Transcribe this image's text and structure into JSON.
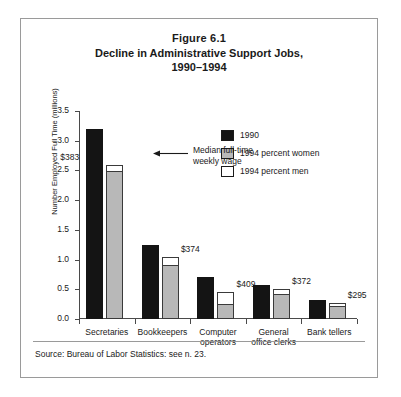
{
  "figure": {
    "number": "Figure 6.1",
    "title": "Decline in Administrative Support Jobs,",
    "title_line2": "1990–1994",
    "source": "Source: Bureau of Labor Statistics: see n. 23.",
    "annotation_line1": "Median full-time",
    "annotation_line2": "weekly wage",
    "arrow_icon": "arrow-left-icon"
  },
  "colors": {
    "bar_1990": "#141414",
    "bar_1994_women": "#b8b8b8",
    "bar_1994_men": "#ffffff",
    "outline": "#3a3a3a",
    "axis": "#4a4a4a",
    "frame": "#9a9a9a"
  },
  "legend": {
    "position": "top-right",
    "items": [
      {
        "label": "1990",
        "swatch": "#141414"
      },
      {
        "label": "1994 percent women",
        "swatch": "#b8b8b8"
      },
      {
        "label": "1994 percent men",
        "swatch": "#ffffff"
      }
    ]
  },
  "chart_data": {
    "type": "bar",
    "title": "Decline in Administrative Support Jobs, 1990–1994",
    "subtitle": "Figure 6.1",
    "xlabel": "",
    "ylabel": "Number Employed Full Time (millions)",
    "ylim": [
      0.0,
      3.5
    ],
    "yticks": [
      0.0,
      0.5,
      1.0,
      1.5,
      2.0,
      2.5,
      3.0,
      3.5
    ],
    "ytick_labels": [
      "0.0",
      "0.5",
      "1.0",
      "1.5",
      "2.0",
      "2.5",
      "3.0",
      "3.5"
    ],
    "grid": false,
    "legend_position": "upper right",
    "categories": [
      "Secretaries",
      "Bookkeepers",
      "Computer operators",
      "General office clerks",
      "Bank tellers"
    ],
    "category_labels": [
      [
        "Secretaries",
        ""
      ],
      [
        "Bookkeepers",
        ""
      ],
      [
        "Computer",
        "operators"
      ],
      [
        "General",
        "office clerks"
      ],
      [
        "Bank tellers",
        ""
      ]
    ],
    "series": [
      {
        "name": "1990",
        "values": [
          3.2,
          1.25,
          0.7,
          0.58,
          0.32
        ]
      },
      {
        "name": "1994 total",
        "values": [
          2.6,
          1.05,
          0.45,
          0.5,
          0.27
        ]
      },
      {
        "name": "1994 percent women",
        "values": [
          2.5,
          0.93,
          0.25,
          0.43,
          0.23
        ]
      },
      {
        "name": "1994 percent men",
        "values": [
          0.1,
          0.12,
          0.2,
          0.07,
          0.04
        ]
      }
    ],
    "data_labels": {
      "name": "Median full-time weekly wage",
      "values": [
        "$383",
        "$374",
        "$409",
        "$372",
        "$295"
      ]
    }
  }
}
